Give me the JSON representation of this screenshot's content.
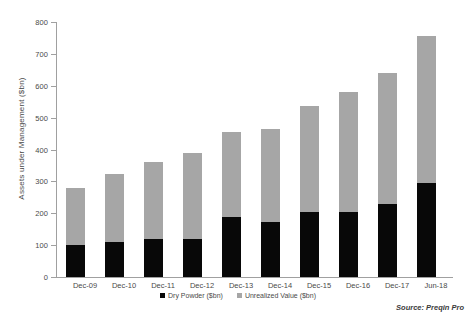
{
  "chart_data": {
    "type": "bar",
    "stacked": true,
    "title": "",
    "xlabel": "",
    "ylabel": "Assets under Management ($bn)",
    "ylim": [
      0,
      800
    ],
    "ytick_step": 100,
    "yticks": [
      0,
      100,
      200,
      300,
      400,
      500,
      600,
      700,
      800
    ],
    "ytick_labels": [
      "0",
      "100",
      "200",
      "300",
      "400",
      "500",
      "600",
      "700",
      "800"
    ],
    "grid": false,
    "legend_position": "bottom",
    "categories": [
      "Dec-09",
      "Dec-10",
      "Dec-11",
      "Dec-12",
      "Dec-13",
      "Dec-14",
      "Dec-15",
      "Dec-16",
      "Dec-17",
      "Jun-18"
    ],
    "series": [
      {
        "name": "Dry Powder ($bn)",
        "color": "#080808",
        "values": [
          101,
          110,
          120,
          120,
          189,
          173,
          205,
          205,
          230,
          296
        ]
      },
      {
        "name": "Unrealized Value ($bn)",
        "color": "#a6a6a6",
        "values": [
          178,
          212,
          241,
          268,
          266,
          291,
          331,
          376,
          410,
          459
        ]
      }
    ],
    "totals": [
      279,
      322,
      361,
      388,
      455,
      464,
      536,
      581,
      640,
      755
    ],
    "annotations": [
      "Source: Preqin Pro"
    ]
  },
  "axis": {
    "y_title": "Assets under Management ($bn)"
  },
  "legend": {
    "items": [
      {
        "label": "Dry Powder ($bn)",
        "color": "#080808",
        "swatch": "square-swatch-dark"
      },
      {
        "label": "Unrealized Value ($bn)",
        "color": "#a6a6a6",
        "swatch": "square-swatch-gray"
      }
    ]
  },
  "footer": {
    "source": "Source: Preqin Pro"
  },
  "colors": {
    "dry_powder": "#080808",
    "unrealized_value": "#a6a6a6",
    "axis": "#a0a0a0",
    "text": "#4a4a4a",
    "background": "#ffffff"
  }
}
